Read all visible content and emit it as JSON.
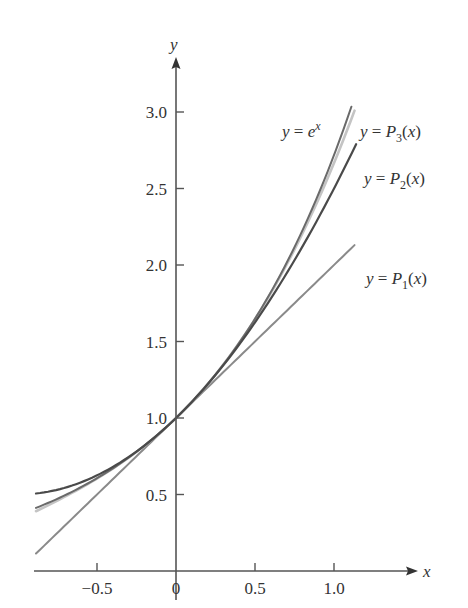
{
  "chart_data": {
    "type": "line",
    "title": "",
    "xlabel": "x",
    "ylabel": "y",
    "xlim": [
      -0.89,
      1.2
    ],
    "ylim": [
      0,
      3.3
    ],
    "grid": false,
    "x_ticks": [
      {
        "value": -0.5,
        "label": "−0.5"
      },
      {
        "value": 0,
        "label": "0"
      },
      {
        "value": 0.5,
        "label": "0.5"
      },
      {
        "value": 1.0,
        "label": "1.0"
      }
    ],
    "y_ticks": [
      {
        "value": 0.5,
        "label": "0.5"
      },
      {
        "value": 1.0,
        "label": "1.0"
      },
      {
        "value": 1.5,
        "label": "1.5"
      },
      {
        "value": 2.0,
        "label": "2.0"
      },
      {
        "value": 2.5,
        "label": "2.5"
      },
      {
        "value": 3.0,
        "label": "3.0"
      }
    ],
    "series": [
      {
        "name": "y = P1(x)",
        "formula": "1 + x",
        "color": "#8a8a8a",
        "width": 2,
        "x_range": [
          -0.886,
          1.13
        ],
        "x": [
          -0.886,
          -0.5,
          0,
          0.5,
          1.0,
          1.13
        ],
        "values": [
          0.114,
          0.5,
          1.0,
          1.5,
          2.0,
          2.13
        ],
        "label": {
          "prefix": "y = ",
          "fn": "P",
          "sub": "1",
          "suffix": "(x)"
        }
      },
      {
        "name": "y = P2(x)",
        "formula": "1 + x + x^2/2",
        "color": "#4a4a4a",
        "width": 2.2,
        "x_range": [
          -0.886,
          1.14
        ],
        "x": [
          -0.886,
          -0.5,
          0,
          0.5,
          1.0,
          1.14
        ],
        "values": [
          0.506,
          0.625,
          1.0,
          1.625,
          2.5,
          2.79
        ],
        "label": {
          "prefix": "y = ",
          "fn": "P",
          "sub": "2",
          "suffix": "(x)"
        }
      },
      {
        "name": "y = P3(x)",
        "formula": "1 + x + x^2/2 + x^3/6",
        "color": "#c4c4c4",
        "width": 2.6,
        "x_range": [
          -0.886,
          1.13
        ],
        "x": [
          -0.886,
          -0.5,
          0,
          0.5,
          1.0,
          1.13
        ],
        "values": [
          0.39,
          0.604,
          1.0,
          1.646,
          2.667,
          3.03
        ],
        "label": {
          "prefix": "y = ",
          "fn": "P",
          "sub": "3",
          "suffix": "(x)"
        }
      },
      {
        "name": "y = e^x",
        "formula": "exp(x)",
        "color": "#6a6a6a",
        "width": 2,
        "x_range": [
          -0.886,
          1.11
        ],
        "x": [
          -0.886,
          -0.5,
          0,
          0.5,
          1.0,
          1.11
        ],
        "values": [
          0.412,
          0.607,
          1.0,
          1.649,
          2.718,
          3.03
        ],
        "label": {
          "prefix": "y = ",
          "fn": "e",
          "sup": "x"
        }
      }
    ],
    "annotations": [
      {
        "text": "y = e^x",
        "x_px": 282,
        "y_px": 137
      },
      {
        "text": "y = P3(x)",
        "x_px": 360,
        "y_px": 137
      },
      {
        "text": "y = P2(x)",
        "x_px": 364,
        "y_px": 184
      },
      {
        "text": "y = P1(x)",
        "x_px": 366,
        "y_px": 284
      }
    ]
  }
}
